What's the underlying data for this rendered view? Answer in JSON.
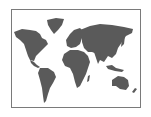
{
  "image": {
    "subject": "world-map",
    "alt": "World map",
    "land_color": "#5a5a5a",
    "frame_color": "#7a7a7a",
    "background_color": "#ffffff"
  }
}
